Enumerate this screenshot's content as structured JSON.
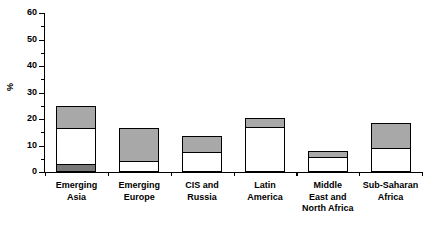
{
  "chart_data": {
    "type": "bar",
    "subtype": "stacked-bar",
    "title": "",
    "subtitle": "",
    "xlabel": "",
    "ylabel": "%",
    "ylim": [
      0,
      60
    ],
    "y_ticks_major": [
      0,
      10,
      20,
      30,
      40,
      50,
      60
    ],
    "y_ticks_minor": [
      5,
      15,
      25,
      35,
      45,
      55
    ],
    "y_tick_labels": [
      "0",
      "10",
      "20",
      "30",
      "40",
      "50",
      "60"
    ],
    "grid": false,
    "legend": false,
    "legend_position": "none",
    "categories": [
      "Emerging\nAsia",
      "Emerging\nEurope",
      "CIS and\nRussia",
      "Latin\nAmerica",
      "Middle\nEast and\nNorth Africa",
      "Sub-Saharan\nAfrica"
    ],
    "series": [
      {
        "name": "bottom-dark-segment",
        "color": "#787878",
        "values": [
          3,
          0,
          0,
          0,
          0,
          0
        ]
      },
      {
        "name": "middle-white-segment",
        "color": "#ffffff",
        "values": [
          13.5,
          4,
          7.5,
          17,
          5.5,
          9
        ]
      },
      {
        "name": "top-gray-segment",
        "color": "#a8a8a8",
        "values": [
          8.5,
          12.5,
          6,
          3.5,
          2.5,
          9.5
        ]
      }
    ],
    "totals": [
      25,
      16.5,
      13.5,
      20.5,
      8,
      18.5
    ]
  },
  "style": {
    "axis_color": "#000000",
    "bar_outline_color": "#000000",
    "background": "#ffffff",
    "gray_fill": "#a8a8a8",
    "dark_fill": "#787878",
    "white_fill": "#ffffff"
  }
}
